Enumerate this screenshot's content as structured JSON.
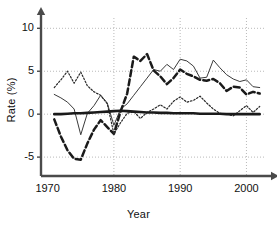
{
  "chart_data": {
    "type": "line",
    "title": "",
    "xlabel": "Year",
    "ylabel": "Rate (%)",
    "xlim": [
      1969.0,
      2002.8
    ],
    "ylim": [
      -7.2,
      11.2
    ],
    "xticks": [
      1970,
      1980,
      1990,
      2000
    ],
    "yticks": [
      -5,
      0,
      5,
      10
    ],
    "grid": true,
    "grid_style": "dotted",
    "legend_position": "none",
    "x": [
      1971,
      1972,
      1973,
      1974,
      1975,
      1976,
      1977,
      1978,
      1979,
      1980,
      1981,
      1982,
      1983,
      1984,
      1985,
      1986,
      1987,
      1988,
      1989,
      1990,
      1991,
      1992,
      1993,
      1994,
      1995,
      1996,
      1997,
      1998,
      1999,
      2000,
      2001,
      2002
    ],
    "series": [
      {
        "name": "thin-solid-series",
        "style": "solid-thin",
        "color": "#3a3a3a",
        "values": [
          2.3,
          1.9,
          1.4,
          0.6,
          -2.4,
          0.1,
          1.0,
          2.2,
          1.3,
          -1.3,
          0.6,
          1.2,
          2.2,
          3.2,
          4.2,
          5.2,
          5.0,
          5.8,
          5.2,
          6.4,
          6.2,
          5.6,
          4.2,
          4.3,
          6.3,
          5.4,
          4.6,
          4.1,
          3.8,
          4.0,
          3.2,
          3.1
        ]
      },
      {
        "name": "thick-dashed-series",
        "style": "dashed-thick",
        "color": "#1a1a1a",
        "values": [
          -0.6,
          -2.6,
          -4.2,
          -5.2,
          -5.3,
          -3.4,
          -1.8,
          -0.7,
          -1.5,
          -2.3,
          0.3,
          2.4,
          6.7,
          6.2,
          7.0,
          5.1,
          4.4,
          3.5,
          4.2,
          5.2,
          4.7,
          4.4,
          4.0,
          3.9,
          4.1,
          3.6,
          2.7,
          3.2,
          3.1,
          2.3,
          2.6,
          2.4
        ]
      },
      {
        "name": "dotted-series",
        "style": "dotted",
        "color": "#2a2a2a",
        "values": [
          3.1,
          4.0,
          5.0,
          3.6,
          4.9,
          3.3,
          2.6,
          2.2,
          1.2,
          -2.3,
          -1.0,
          0.1,
          0.3,
          -0.5,
          0.2,
          0.6,
          1.1,
          0.6,
          1.5,
          2.0,
          1.4,
          1.6,
          2.1,
          1.3,
          0.6,
          0.1,
          0.0,
          -0.2,
          0.4,
          1.0,
          0.2,
          0.9
        ]
      },
      {
        "name": "zero-reference-series",
        "style": "solid-thick",
        "color": "#1a1a1a",
        "values": [
          0.0,
          0.0,
          0.05,
          0.1,
          0.1,
          0.15,
          0.2,
          0.25,
          0.3,
          0.35,
          0.4,
          0.35,
          0.3,
          0.25,
          0.2,
          0.2,
          0.15,
          0.15,
          0.1,
          0.1,
          0.1,
          0.1,
          0.05,
          0.05,
          0.05,
          0.05,
          0.0,
          0.0,
          0.0,
          0.0,
          0.0,
          0.0
        ]
      }
    ]
  },
  "axis": {
    "y_tick_labels": [
      "10",
      "5",
      "0",
      "-5"
    ],
    "x_tick_labels": [
      "1970",
      "1980",
      "1990",
      "2000"
    ]
  },
  "colors": {
    "axis": "#4a4a4a",
    "grid": "#b9b9b9",
    "text": "#111111",
    "background": "#ffffff"
  }
}
